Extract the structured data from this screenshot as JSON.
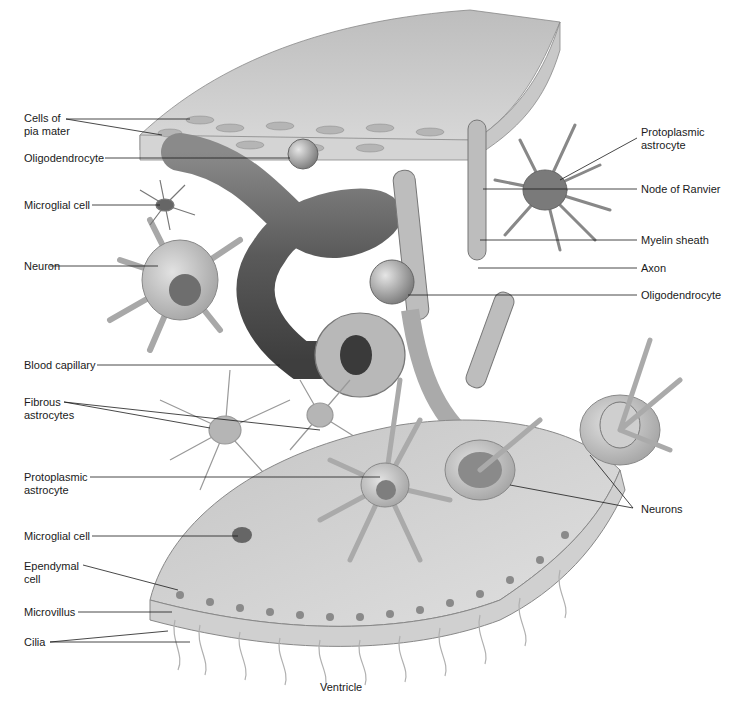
{
  "figure": {
    "bottom_label": "Ventricle"
  },
  "labels_left": [
    {
      "id": "cells-of-pia-mater",
      "text": "Cells of\npia mater"
    },
    {
      "id": "oligodendrocyte-left",
      "text": "Oligodendrocyte"
    },
    {
      "id": "microglial-cell-top",
      "text": "Microglial cell"
    },
    {
      "id": "neuron",
      "text": "Neuron"
    },
    {
      "id": "blood-capillary",
      "text": "Blood capillary"
    },
    {
      "id": "fibrous-astrocytes",
      "text": "Fibrous\nastrocytes"
    },
    {
      "id": "protoplasmic-astrocyte-left",
      "text": "Protoplasmic\nastrocyte"
    },
    {
      "id": "microglial-cell-bottom",
      "text": "Microglial cell"
    },
    {
      "id": "ependymal-cell",
      "text": "Ependymal\ncell"
    },
    {
      "id": "microvillus",
      "text": "Microvillus"
    },
    {
      "id": "cilia",
      "text": "Cilia"
    }
  ],
  "labels_right": [
    {
      "id": "protoplasmic-astrocyte-right",
      "text": "Protoplasmic\nastrocyte"
    },
    {
      "id": "node-of-ranvier",
      "text": "Node of Ranvier"
    },
    {
      "id": "myelin-sheath",
      "text": "Myelin sheath"
    },
    {
      "id": "axon",
      "text": "Axon"
    },
    {
      "id": "oligodendrocyte-right",
      "text": "Oligodendrocyte"
    },
    {
      "id": "neurons",
      "text": "Neurons"
    }
  ],
  "colors": {
    "tissue_light": "#d8d8d8",
    "tissue_mid": "#a9a9a9",
    "tissue_dark": "#6e6e6e",
    "vessel": "#5c5c5c",
    "leader_line": "#1a1a1a"
  }
}
